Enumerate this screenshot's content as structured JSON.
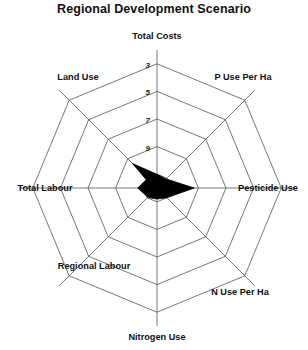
{
  "chart_data": {
    "type": "radar",
    "title": "Regional Development Scenario",
    "xlabel": "",
    "ylabel": "",
    "categories": [
      "Total Costs",
      "P Use Per Ha",
      "Pesticide Use",
      "N Use Per Ha",
      "Nitrogen Use",
      "Regional Labour",
      "Total Labour",
      "Land Use"
    ],
    "values": [
      1.0,
      0.9,
      2.7,
      1.0,
      0.8,
      1.0,
      1.4,
      3.0
    ],
    "series": [
      {
        "name": "Regional Development Scenario",
        "values": [
          1.0,
          0.9,
          2.7,
          1.0,
          0.8,
          1.0,
          1.4,
          3.0
        ]
      }
    ],
    "rlim": [
      0,
      10
    ],
    "tick_labels": [
      "3",
      "5",
      "7",
      "9"
    ],
    "tick_values": [
      3,
      5,
      7,
      9
    ],
    "ring_values": [
      1,
      3,
      5,
      7,
      9
    ],
    "grid": true,
    "legend": "none",
    "fill_color": "#000000",
    "grid_color": "#555555"
  },
  "axis_labels": {
    "top": "Total Costs",
    "upper_right": "P Use Per Ha",
    "right": "Pesticide Use",
    "lower_right": "N Use Per Ha",
    "bottom": "Nitrogen Use",
    "lower_left": "Regional Labour",
    "left": "Total Labour",
    "upper_left": "Land Use"
  },
  "ticks": {
    "t9": "9",
    "t7": "7",
    "t5": "5",
    "t3": "3"
  }
}
